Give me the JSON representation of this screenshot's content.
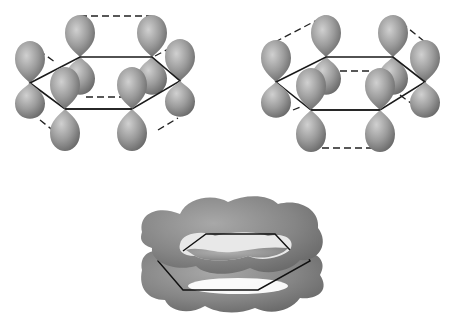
{
  "figure": {
    "panels": [
      {
        "id": "kekule-1",
        "label": "",
        "description": "Six p-orbital lobes on hexagon, dashed pairings (Kekulé structure 1)"
      },
      {
        "id": "kekule-2",
        "label": "",
        "description": "Six p-orbital lobes on hexagon, dashed pairings (Kekulé structure 2)"
      },
      {
        "id": "delocalized",
        "label": "",
        "description": "Delocalized pi electron cloud above and below ring"
      }
    ],
    "colors": {
      "lobe_light": "#c8c8c8",
      "lobe_mid": "#9a9a9a",
      "lobe_dark": "#6e6e6e",
      "bond_line": "#1a1a1a",
      "background": "#ffffff"
    }
  }
}
